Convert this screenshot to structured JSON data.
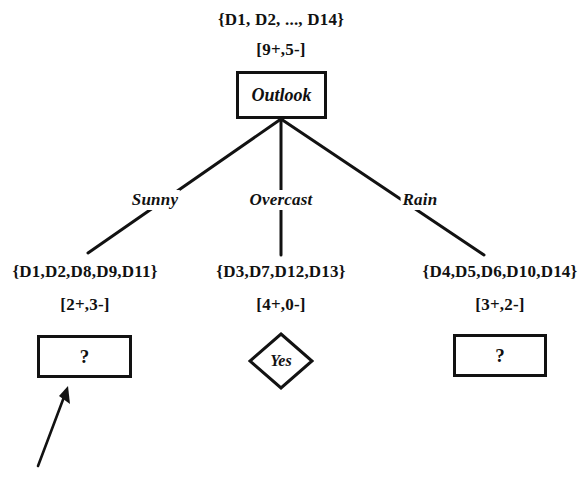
{
  "diagram": {
    "root": {
      "set_label": "{D1, D2, ..., D14}",
      "count_label": "[9+,5-]",
      "node_text": "Outlook",
      "node_shape": "rectangle"
    },
    "branches": [
      {
        "edge_label": "Sunny",
        "set_label": "{D1,D2,D8,D9,D11}",
        "count_label": "[2+,3-]",
        "node_text": "?",
        "node_shape": "rectangle"
      },
      {
        "edge_label": "Overcast",
        "set_label": "{D3,D7,D12,D13}",
        "count_label": "[4+,0-]",
        "node_text": "Yes",
        "node_shape": "diamond"
      },
      {
        "edge_label": "Rain",
        "set_label": "{D4,D5,D6,D10,D14}",
        "count_label": "[3+,2-]",
        "node_text": "?",
        "node_shape": "rectangle"
      }
    ],
    "annotation": {
      "arrow_name": "pointer-arrow",
      "arrow_target": "sunny-leaf-node"
    },
    "colors": {
      "ink": "#121212",
      "background": "#ffffff"
    }
  }
}
